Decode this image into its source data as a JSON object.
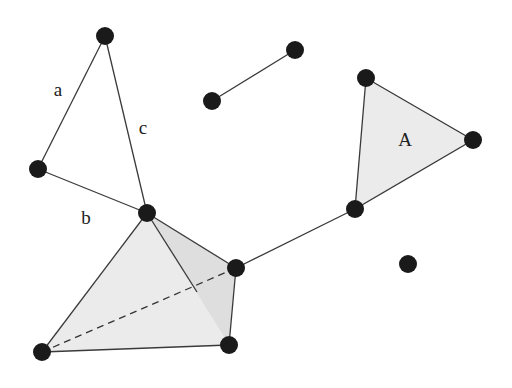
{
  "diagram": {
    "colors": {
      "background": "#ffffff",
      "vertex": "#1a1a1a",
      "edge": "#3a3a3a",
      "face_fill": "#ebebeb",
      "face_shade": "#dcdcdc"
    },
    "vertices": [
      {
        "id": "v1",
        "x": 105,
        "y": 36
      },
      {
        "id": "v2",
        "x": 38,
        "y": 169
      },
      {
        "id": "v3",
        "x": 147,
        "y": 213
      },
      {
        "id": "v4",
        "x": 212,
        "y": 101
      },
      {
        "id": "v5",
        "x": 295,
        "y": 50
      },
      {
        "id": "v6",
        "x": 366,
        "y": 78
      },
      {
        "id": "v7",
        "x": 473,
        "y": 140
      },
      {
        "id": "v8",
        "x": 355,
        "y": 209
      },
      {
        "id": "v9",
        "x": 408,
        "y": 264
      },
      {
        "id": "v10",
        "x": 236,
        "y": 268
      },
      {
        "id": "v11",
        "x": 42,
        "y": 352
      },
      {
        "id": "v12",
        "x": 229,
        "y": 345
      }
    ],
    "edges": [
      {
        "from": "v1",
        "to": "v2",
        "label": "a"
      },
      {
        "from": "v2",
        "to": "v3",
        "label": "b"
      },
      {
        "from": "v1",
        "to": "v3",
        "label": "c"
      },
      {
        "from": "v4",
        "to": "v5",
        "label": ""
      },
      {
        "from": "v10",
        "to": "v8",
        "label": ""
      }
    ],
    "edge_labels": [
      {
        "text": "a",
        "x": 58,
        "y": 96
      },
      {
        "text": "c",
        "x": 143,
        "y": 134
      },
      {
        "text": "b",
        "x": 86,
        "y": 224
      }
    ],
    "triangle": {
      "label": "A",
      "label_x": 405,
      "label_y": 146,
      "vertices": [
        "v6",
        "v7",
        "v8"
      ]
    },
    "tetrahedron": {
      "apex": "v3",
      "base": [
        "v11",
        "v12",
        "v10"
      ],
      "hidden_edge": {
        "from": "v11",
        "to": "v10"
      }
    },
    "isolated_vertex": "v9"
  }
}
